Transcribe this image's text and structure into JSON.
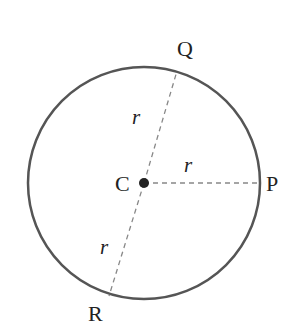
{
  "diagram": {
    "center": {
      "label": "C",
      "x": 144,
      "y": 183
    },
    "radius_px": 116,
    "points": [
      {
        "label": "P",
        "x": 260,
        "y": 183
      },
      {
        "label": "Q",
        "x": 177,
        "y": 71
      },
      {
        "label": "R",
        "x": 109,
        "y": 296
      }
    ],
    "radius_labels": [
      {
        "text": "r",
        "x": 135,
        "y": 123
      },
      {
        "text": "r",
        "x": 188,
        "y": 172
      },
      {
        "text": "r",
        "x": 103,
        "y": 252
      }
    ],
    "colors": {
      "circle": "#555555",
      "dashed": "#888888",
      "center_dot": "#222222",
      "text": "#222222"
    }
  }
}
